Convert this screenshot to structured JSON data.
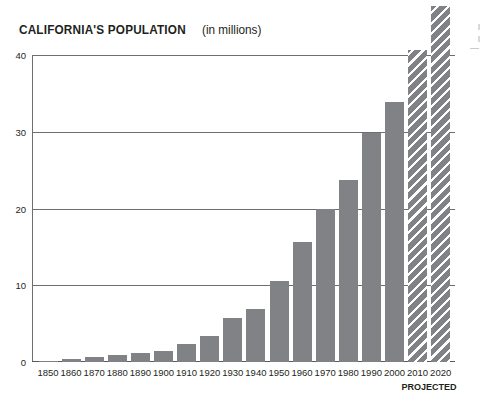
{
  "chart": {
    "title_main": "CALIFORNIA'S POPULATION",
    "title_sub": "(in millions)",
    "projected_note": "PROJECTED"
  },
  "chart_data": {
    "type": "bar",
    "title": "CALIFORNIA'S POPULATION (in millions)",
    "xlabel": "",
    "ylabel": "",
    "ylim": [
      0,
      40
    ],
    "yticks": [
      0,
      10,
      20,
      30,
      40
    ],
    "ytick_labels": [
      "0",
      "10",
      "20",
      "30",
      "40"
    ],
    "grid": "horizontal",
    "legend": "none",
    "units": "millions of people",
    "note": "2010 and 2020 bars are hatched to indicate projected values; the 2020 bar extends above the top of the plotted area.",
    "categories": [
      "1850",
      "1860",
      "1870",
      "1880",
      "1890",
      "1900",
      "1910",
      "1920",
      "1930",
      "1940",
      "1950",
      "1960",
      "1970",
      "1980",
      "1990",
      "2000",
      "2010",
      "2020"
    ],
    "values": [
      0.1,
      0.4,
      0.6,
      0.9,
      1.2,
      1.5,
      2.4,
      3.4,
      5.7,
      6.9,
      10.6,
      15.7,
      20.0,
      23.7,
      29.8,
      33.9,
      40.6,
      46.4
    ],
    "series": [
      {
        "name": "Population (millions)",
        "values": [
          0.1,
          0.4,
          0.6,
          0.9,
          1.2,
          1.5,
          2.4,
          3.4,
          5.7,
          6.9,
          10.6,
          15.7,
          20.0,
          23.7,
          29.8,
          33.9,
          40.6,
          46.4
        ],
        "projected_flags": [
          false,
          false,
          false,
          false,
          false,
          false,
          false,
          false,
          false,
          false,
          false,
          false,
          false,
          false,
          false,
          false,
          true,
          true
        ]
      }
    ],
    "colors": {
      "bar": "#808285",
      "projected_bar": "#808285",
      "projected_hatch": "#ffffff",
      "gridline": "#6d6e71",
      "axis": "#58595b",
      "text": "#231f20",
      "background": "#ffffff"
    }
  }
}
